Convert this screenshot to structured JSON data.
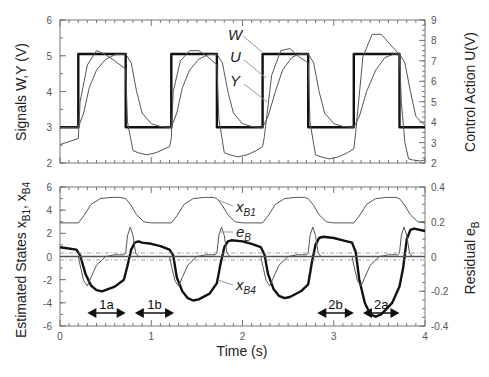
{
  "chart_data": [
    {
      "type": "line",
      "panel": "top",
      "title": "",
      "xlabel": "Time (s)",
      "ylabel_left": "Signals W,Y (V)",
      "ylabel_right": "Control Action U(V)",
      "xlim": [
        0,
        4
      ],
      "ylim_left": [
        2,
        6
      ],
      "ylim_right": [
        2,
        9
      ],
      "yticks_left": [
        2,
        3,
        4,
        5,
        6
      ],
      "yticks_right": [
        2,
        3,
        4,
        5,
        6,
        7,
        8,
        9
      ],
      "grid": false,
      "series": [
        {
          "name": "W",
          "axis": "left",
          "style": "thick",
          "x": [
            0,
            0.2,
            0.2,
            0.72,
            0.72,
            1.22,
            1.22,
            1.72,
            1.72,
            2.22,
            2.22,
            2.72,
            2.72,
            3.22,
            3.22,
            3.72,
            3.72,
            4.0
          ],
          "y": [
            3,
            3,
            5.05,
            5.05,
            3,
            3,
            5.05,
            5.05,
            3,
            3,
            5.05,
            5.05,
            3,
            3,
            5.05,
            5.05,
            3,
            3
          ]
        },
        {
          "name": "Y",
          "axis": "left",
          "style": "thin",
          "x": [
            0,
            0.2,
            0.26,
            0.32,
            0.4,
            0.5,
            0.6,
            0.72,
            0.78,
            0.84,
            0.9,
            1.0,
            1.1,
            1.22,
            1.28,
            1.34,
            1.42,
            1.52,
            1.62,
            1.72,
            1.78,
            1.84,
            1.9,
            2.0,
            2.1,
            2.22,
            2.28,
            2.36,
            2.44,
            2.54,
            2.62,
            2.72,
            2.78,
            2.84,
            2.9,
            3.0,
            3.1,
            3.22,
            3.28,
            3.36,
            3.46,
            3.56,
            3.66,
            3.72,
            3.78,
            3.84,
            3.9,
            4.0
          ],
          "y": [
            3,
            3,
            3.4,
            4.1,
            4.6,
            4.9,
            5.03,
            5.05,
            4.8,
            4.0,
            3.4,
            3.1,
            3.02,
            3,
            3.4,
            4.1,
            4.6,
            4.9,
            5.03,
            5.05,
            4.8,
            4.0,
            3.4,
            3.1,
            3.02,
            3.0,
            3.3,
            4.0,
            4.6,
            4.95,
            5.05,
            5.05,
            4.8,
            4.0,
            3.4,
            3.1,
            3.02,
            3.0,
            3.3,
            4.0,
            4.6,
            4.95,
            5.05,
            5.05,
            4.8,
            4.0,
            3.3,
            3.05
          ]
        },
        {
          "name": "U",
          "axis": "right",
          "style": "thin",
          "x": [
            0,
            0.2,
            0.22,
            0.3,
            0.4,
            0.5,
            0.6,
            0.72,
            0.74,
            0.8,
            0.86,
            0.95,
            1.05,
            1.15,
            1.2,
            1.22,
            1.24,
            1.32,
            1.42,
            1.52,
            1.62,
            1.72,
            1.74,
            1.8,
            1.86,
            1.95,
            2.05,
            2.15,
            2.22,
            2.24,
            2.32,
            2.42,
            2.52,
            2.62,
            2.72,
            2.74,
            2.8,
            2.86,
            2.95,
            3.05,
            3.15,
            3.22,
            3.24,
            3.32,
            3.42,
            3.52,
            3.62,
            3.72,
            3.74,
            3.78,
            3.82,
            3.86,
            3.95,
            4.0
          ],
          "y": [
            2.9,
            3.2,
            5.0,
            6.8,
            7.5,
            7.3,
            7.0,
            6.6,
            4.0,
            2.6,
            2.5,
            2.4,
            2.5,
            2.7,
            2.8,
            3.2,
            5.5,
            7.0,
            7.5,
            7.5,
            7.2,
            6.8,
            4.2,
            2.5,
            2.4,
            2.3,
            2.4,
            2.6,
            2.8,
            3.3,
            6.3,
            7.5,
            7.6,
            7.2,
            6.9,
            4.0,
            2.4,
            2.3,
            2.2,
            2.3,
            2.5,
            2.7,
            3.5,
            7.2,
            8.3,
            8.3,
            7.8,
            7.3,
            5.0,
            3.0,
            2.2,
            2.15,
            2.1,
            2.15
          ]
        }
      ],
      "annotations": [
        "W",
        "U",
        "Y"
      ]
    },
    {
      "type": "line",
      "panel": "bottom",
      "xlabel": "Time (s)",
      "ylabel_left": "Estimated States x_B1, x_B4",
      "ylabel_right": "Residual e_B",
      "xlim": [
        0,
        4
      ],
      "ylim_left": [
        -6,
        6
      ],
      "ylim_right": [
        -0.4,
        0.4
      ],
      "xticks": [
        0,
        1,
        2,
        3,
        4
      ],
      "yticks_left": [
        -6,
        -4,
        -2,
        0,
        2,
        4,
        6
      ],
      "yticks_right": [
        -0.4,
        -0.2,
        0,
        0.2,
        0.4
      ],
      "grid": false,
      "series": [
        {
          "name": "x_B1",
          "axis": "left",
          "style": "thin",
          "x": [
            0,
            0.2,
            0.26,
            0.34,
            0.44,
            0.56,
            0.66,
            0.72,
            0.78,
            0.84,
            0.92,
            1.0,
            1.22,
            1.28,
            1.36,
            1.46,
            1.58,
            1.68,
            1.72,
            1.78,
            1.84,
            1.92,
            2.0,
            2.22,
            2.28,
            2.36,
            2.46,
            2.58,
            2.68,
            2.72,
            2.78,
            2.84,
            2.92,
            3.0,
            3.22,
            3.28,
            3.36,
            3.46,
            3.58,
            3.68,
            3.72,
            3.78,
            3.84,
            3.92,
            4.0
          ],
          "y": [
            2.9,
            2.9,
            3.5,
            4.5,
            5.0,
            5.1,
            5.1,
            5.0,
            4.4,
            3.6,
            3.0,
            2.9,
            2.9,
            3.5,
            4.5,
            5.0,
            5.1,
            5.1,
            5.0,
            4.4,
            3.6,
            3.0,
            2.9,
            2.9,
            3.5,
            4.5,
            5.0,
            5.1,
            5.1,
            5.0,
            4.4,
            3.6,
            3.0,
            2.9,
            2.9,
            3.5,
            4.5,
            5.0,
            5.1,
            5.1,
            5.0,
            4.4,
            3.6,
            3.0,
            2.9
          ]
        },
        {
          "name": "x_B4",
          "axis": "left",
          "style": "thick",
          "x": [
            0,
            0.18,
            0.22,
            0.28,
            0.34,
            0.4,
            0.46,
            0.6,
            0.7,
            0.74,
            0.78,
            0.82,
            0.86,
            0.9,
            1.0,
            1.1,
            1.2,
            1.24,
            1.28,
            1.34,
            1.4,
            1.46,
            1.52,
            1.64,
            1.72,
            1.76,
            1.8,
            1.84,
            1.88,
            2.0,
            2.1,
            2.2,
            2.24,
            2.28,
            2.34,
            2.4,
            2.46,
            2.52,
            2.64,
            2.72,
            2.76,
            2.8,
            2.84,
            2.88,
            3.0,
            3.1,
            3.2,
            3.24,
            3.28,
            3.34,
            3.4,
            3.46,
            3.52,
            3.64,
            3.72,
            3.76,
            3.8,
            3.84,
            3.88,
            4.0
          ],
          "y": [
            0.8,
            0.6,
            0.1,
            -1.5,
            -2.5,
            -2.9,
            -3.0,
            -2.6,
            -2.0,
            -0.8,
            0.6,
            1.2,
            1.3,
            1.2,
            1.1,
            0.9,
            0.6,
            0.1,
            -1.8,
            -3.0,
            -3.6,
            -3.8,
            -3.7,
            -3.2,
            -2.3,
            -0.6,
            0.8,
            1.3,
            1.4,
            1.3,
            1.1,
            0.8,
            0.2,
            -1.5,
            -2.8,
            -3.4,
            -3.6,
            -3.5,
            -3.0,
            -2.4,
            -0.5,
            1.0,
            1.6,
            1.7,
            1.6,
            1.4,
            1.2,
            0.4,
            -2.0,
            -4.0,
            -5.0,
            -5.2,
            -5.0,
            -4.0,
            -2.6,
            -1.0,
            1.5,
            2.3,
            2.4,
            2.2
          ]
        },
        {
          "name": "e_B",
          "axis": "right",
          "style": "thin",
          "x": [
            0,
            0.2,
            0.22,
            0.26,
            0.3,
            0.34,
            0.4,
            0.5,
            0.6,
            0.7,
            0.72,
            0.74,
            0.77,
            0.8,
            0.83,
            0.86,
            1.0,
            1.2,
            1.22,
            1.26,
            1.3,
            1.34,
            1.4,
            1.5,
            1.6,
            1.7,
            1.72,
            1.74,
            1.77,
            1.8,
            1.83,
            1.86,
            2.0,
            2.2,
            2.22,
            2.26,
            2.3,
            2.34,
            2.4,
            2.5,
            2.6,
            2.7,
            2.72,
            2.74,
            2.77,
            2.8,
            2.83,
            2.86,
            3.0,
            3.2,
            3.22,
            3.26,
            3.3,
            3.34,
            3.4,
            3.5,
            3.6,
            3.7,
            3.72,
            3.74,
            3.77,
            3.8,
            3.83,
            3.86,
            4.0
          ],
          "y": [
            0,
            0,
            -0.05,
            -0.14,
            -0.17,
            -0.12,
            -0.05,
            0.0,
            0.01,
            0.01,
            0.02,
            0.12,
            0.17,
            0.12,
            0.02,
            0.0,
            0,
            0,
            -0.05,
            -0.14,
            -0.17,
            -0.12,
            -0.05,
            0.0,
            0.01,
            0.01,
            0.02,
            0.12,
            0.17,
            0.12,
            0.02,
            0.0,
            0,
            0,
            -0.05,
            -0.14,
            -0.17,
            -0.12,
            -0.05,
            0.0,
            0.01,
            0.01,
            0.02,
            0.12,
            0.17,
            0.12,
            0.02,
            0.0,
            0,
            0,
            -0.05,
            -0.14,
            -0.17,
            -0.12,
            -0.05,
            0.0,
            0.01,
            0.01,
            0.02,
            0.12,
            0.17,
            0.12,
            0.02,
            0.0,
            0
          ]
        },
        {
          "name": "thresholds",
          "axis": "right",
          "style": "dash",
          "levels": [
            0.02,
            -0.02
          ]
        }
      ],
      "annotations": [
        {
          "text": "1a",
          "x_start": 0.3,
          "x_end": 0.72
        },
        {
          "text": "1b",
          "x_start": 0.82,
          "x_end": 1.25
        },
        {
          "text": "2b",
          "x_start": 2.82,
          "x_end": 3.22
        },
        {
          "text": "2a",
          "x_start": 3.32,
          "x_end": 3.72
        }
      ]
    }
  ],
  "labels": {
    "top_ylabel_left": "Signals W,Y (V)",
    "top_ylabel_right": "Control Action  U(V)",
    "bottom_ylabel_left": "Estimated States  x",
    "bottom_ylabel_right": "Residual  e",
    "xlabel": "Time (s)",
    "curve_W": "W",
    "curve_U": "U",
    "curve_Y": "Y",
    "curve_xB1": "x",
    "curve_xB1_sub": "B1",
    "curve_eB": "e",
    "curve_eB_sub": "B",
    "curve_xB4": "x",
    "curve_xB4_sub": "B4"
  },
  "colors": {
    "axis": "#666666",
    "thick_line": "#111111",
    "thin_line": "#444444",
    "leader": "#999999"
  }
}
